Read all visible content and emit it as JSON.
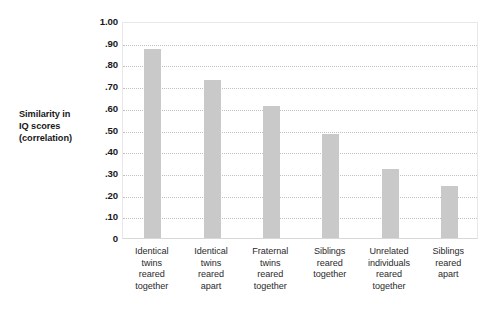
{
  "chart_data": {
    "type": "bar",
    "title": "",
    "xlabel": "",
    "ylabel": "Similarity in IQ scores (correlation)",
    "ylabel_lines": [
      "Similarity in",
      "IQ scores",
      "(correlation)"
    ],
    "ylim": [
      0,
      1.0
    ],
    "ytick_values": [
      1.0,
      0.9,
      0.8,
      0.7,
      0.6,
      0.5,
      0.4,
      0.3,
      0.2,
      0.1,
      0
    ],
    "ytick_labels": [
      "1.00",
      ".90",
      ".80",
      ".70",
      ".60",
      ".50",
      ".40",
      ".30",
      ".20",
      ".10",
      "0"
    ],
    "grid": "horizontal-dotted",
    "legend": "none",
    "bar_color": "#c9c9c9",
    "categories": [
      "Identical twins reared together",
      "Identical twins reared apart",
      "Fraternal twins reared together",
      "Siblings reared together",
      "Unrelated individuals reared together",
      "Siblings reared apart"
    ],
    "category_label_lines": [
      [
        "Identical",
        "twins",
        "reared",
        "together"
      ],
      [
        "Identical",
        "twins",
        "reared",
        "apart"
      ],
      [
        "Fraternal",
        "twins",
        "reared",
        "together"
      ],
      [
        "Siblings",
        "reared",
        "together"
      ],
      [
        "Unrelated",
        "individuals",
        "reared",
        "together"
      ],
      [
        "Siblings",
        "reared",
        "apart"
      ]
    ],
    "values": [
      0.87,
      0.73,
      0.61,
      0.48,
      0.32,
      0.24
    ]
  }
}
